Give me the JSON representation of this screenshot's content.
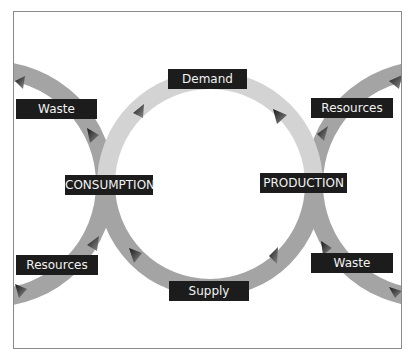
{
  "diagram": {
    "type": "cycle",
    "colors": {
      "demand_arc": "#d3d3d3",
      "cycle_arc": "#a4a4a4",
      "label_bg": "#1c1c1c",
      "label_text": "#f2f2f2",
      "border": "#8a8a8a"
    },
    "nodes": {
      "consumption": "CONSUMPTION",
      "production": "PRODUCTION"
    },
    "flows": {
      "demand": "Demand",
      "supply": "Supply",
      "left_waste": "Waste",
      "left_resources": "Resources",
      "right_resources": "Resources",
      "right_waste": "Waste"
    }
  }
}
